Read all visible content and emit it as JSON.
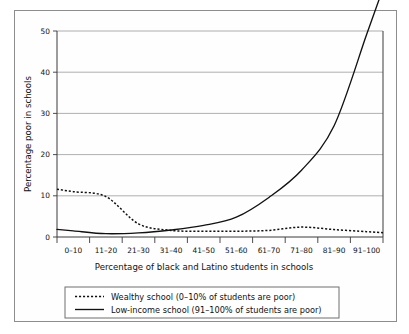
{
  "chart_data": {
    "type": "line",
    "title": "",
    "xlabel": "Percentage of black and Latino students in schools",
    "ylabel": "Percentage poor in schools",
    "categories": [
      "0–10",
      "11–20",
      "21–30",
      "31–40",
      "41–50",
      "51–60",
      "61–70",
      "71–80",
      "81–90",
      "91–100"
    ],
    "ytick_labels": [
      "0",
      "10",
      "20",
      "30",
      "40",
      "50"
    ],
    "ytick_values": [
      0,
      10,
      20,
      30,
      40,
      50
    ],
    "ylim": [
      0,
      50
    ],
    "grid": "horizontal",
    "legend_position": "below-axis",
    "series": [
      {
        "name": "Wealthy school (0–10% of students are poor)",
        "style": "dashed",
        "color": "#111111",
        "values": [
          11.0,
          9.8,
          3.2,
          1.6,
          1.4,
          1.4,
          1.6,
          2.4,
          1.8,
          1.3
        ]
      },
      {
        "name": "Low-income school (91–100% of students are poor)",
        "style": "solid",
        "color": "#111111",
        "values": [
          1.5,
          0.8,
          1.0,
          1.7,
          2.8,
          4.8,
          9.6,
          16.2,
          27.0,
          49.2
        ]
      }
    ]
  },
  "legend": {
    "entries": [
      {
        "sample": "dashed-line-sample",
        "label": "Wealthy school (0–10% of students are poor)"
      },
      {
        "sample": "solid-line-sample",
        "label": "Low-income school (91–100% of students are poor)"
      }
    ]
  },
  "axes": {
    "y_title": "Percentage poor in schools",
    "x_title": "Percentage of black and Latino students in schools"
  }
}
